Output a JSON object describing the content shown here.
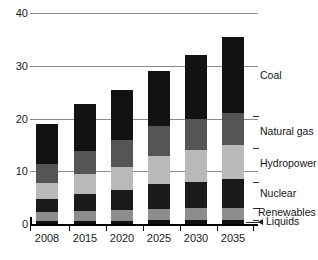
{
  "chart_data": {
    "type": "bar",
    "subtype": "stacked-bar",
    "title": "",
    "xlabel": "",
    "ylabel": "",
    "categories": [
      "2008",
      "2015",
      "2020",
      "2025",
      "2030",
      "2035"
    ],
    "ylim": [
      0,
      40
    ],
    "yticks": [
      0,
      10,
      20,
      30,
      40
    ],
    "ytick_labels": [
      "0",
      "10",
      "20",
      "30",
      "40"
    ],
    "grid": true,
    "legend_position": "right-inline",
    "series": [
      {
        "name": "Liquids",
        "color": "#111111",
        "values": [
          0.6,
          0.6,
          0.6,
          0.7,
          0.7,
          0.7
        ]
      },
      {
        "name": "Renewables",
        "color": "#8d8d8d",
        "values": [
          1.6,
          1.9,
          2.0,
          2.2,
          2.3,
          2.4
        ]
      },
      {
        "name": "Nuclear",
        "color": "#1a1a1a",
        "values": [
          2.6,
          3.2,
          3.9,
          4.6,
          5.0,
          5.5
        ]
      },
      {
        "name": "Hydropower",
        "color": "#b9b9b9",
        "values": [
          3.0,
          3.7,
          4.4,
          5.3,
          6.0,
          6.4
        ]
      },
      {
        "name": "Natural gas",
        "color": "#555555",
        "values": [
          3.6,
          4.5,
          5.1,
          5.7,
          6.0,
          6.1
        ]
      },
      {
        "name": "Coal",
        "color": "#121212",
        "values": [
          7.6,
          8.8,
          9.5,
          10.5,
          12.0,
          14.4
        ]
      }
    ],
    "totals": [
      19.0,
      22.7,
      25.5,
      29.0,
      32.0,
      35.5
    ],
    "annotations": [
      {
        "label": "Coal",
        "value": 28.0
      },
      {
        "label": "Natural gas",
        "value": 17.5
      },
      {
        "label": "Hydropower",
        "value": 11.3
      },
      {
        "label": "Nuclear",
        "value": 5.7
      },
      {
        "label": "Renewables",
        "value": 2.0
      },
      {
        "label": "Liquids",
        "value": 0.3
      }
    ]
  }
}
